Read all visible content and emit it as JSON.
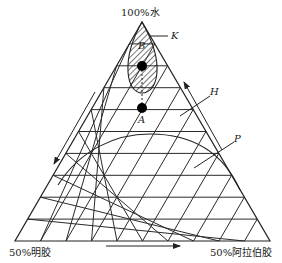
{
  "diagram": {
    "type": "ternary-phase-diagram",
    "grid_divisions": 10,
    "vertices": {
      "top": "100%水",
      "bottom_left": "50%明胶",
      "bottom_right": "50%阿拉伯胶"
    },
    "points": {
      "A": "A",
      "B": "B"
    },
    "regions": {
      "K": "K",
      "H": "H",
      "P": "P"
    },
    "colors": {
      "line": "#2a2a2a",
      "background": "#ffffff",
      "dot": "#000000"
    }
  }
}
